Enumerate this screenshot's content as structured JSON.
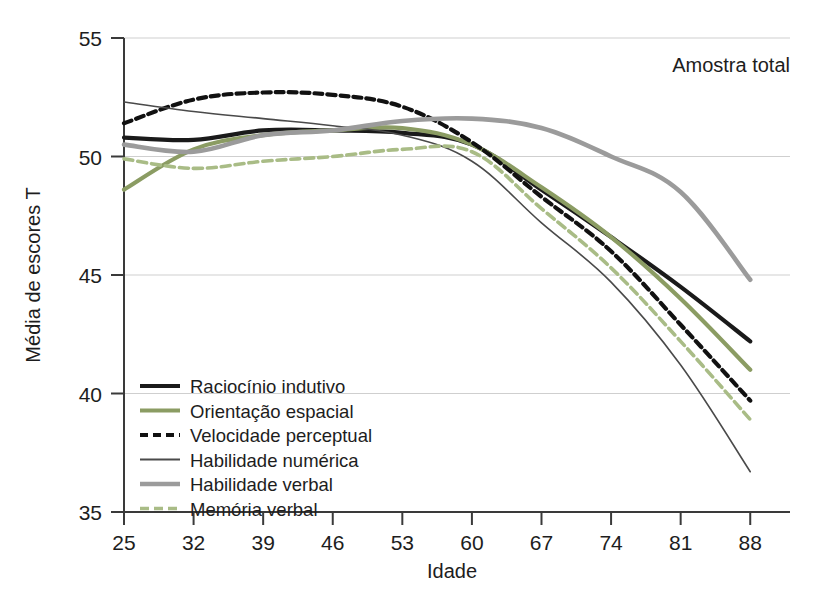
{
  "chart_data": {
    "type": "line",
    "title": "",
    "annotation": "Amostra total",
    "xlabel": "Idade",
    "ylabel": "Média de escores T",
    "x": [
      25,
      32,
      39,
      46,
      53,
      60,
      67,
      74,
      81,
      88
    ],
    "xticklabels": [
      "25",
      "32",
      "39",
      "46",
      "53",
      "60",
      "67",
      "74",
      "81",
      "88"
    ],
    "yticklabels": [
      "35",
      "40",
      "45",
      "50",
      "55"
    ],
    "yticks": [
      35,
      40,
      45,
      50,
      55
    ],
    "xlim": [
      25,
      92
    ],
    "ylim": [
      35,
      55
    ],
    "grid": true,
    "legend_position": "lower-left-inside",
    "series": [
      {
        "name": "Raciocínio indutivo",
        "color": "#1a1a1a",
        "width": 4.2,
        "dash": "none",
        "values": [
          50.8,
          50.7,
          51.1,
          51.1,
          51.0,
          50.5,
          48.6,
          46.6,
          44.5,
          42.2
        ]
      },
      {
        "name": "Orientação espacial",
        "color": "#8b9c63",
        "width": 4.2,
        "dash": "none",
        "values": [
          48.6,
          50.3,
          50.9,
          51.1,
          51.2,
          50.5,
          48.7,
          46.6,
          44.0,
          41.0
        ]
      },
      {
        "name": "Velocidade perceptual",
        "color": "#111111",
        "width": 4.2,
        "dash": "8,5",
        "values": [
          51.4,
          52.4,
          52.7,
          52.6,
          52.1,
          50.6,
          48.3,
          46.0,
          42.9,
          39.7
        ]
      },
      {
        "name": "Habilidade numérica",
        "color": "#4a4a4a",
        "width": 1.6,
        "dash": "none",
        "values": [
          52.3,
          51.9,
          51.6,
          51.3,
          50.9,
          49.8,
          47.2,
          44.7,
          41.2,
          36.7
        ]
      },
      {
        "name": "Habilidade verbal",
        "color": "#9b9b9b",
        "width": 4.6,
        "dash": "none",
        "values": [
          50.5,
          50.2,
          50.9,
          51.1,
          51.5,
          51.6,
          51.2,
          50.0,
          48.5,
          44.8
        ]
      },
      {
        "name": "Memória verbal",
        "color": "#a9bc86",
        "width": 3.6,
        "dash": "9,5",
        "values": [
          49.9,
          49.5,
          49.8,
          50.0,
          50.3,
          50.2,
          47.8,
          45.3,
          42.2,
          38.9
        ]
      }
    ]
  },
  "legend": {
    "items": [
      "Raciocínio indutivo",
      "Orientação espacial",
      "Velocidade perceptual",
      "Habilidade numérica",
      "Habilidade verbal",
      "Memória verbal"
    ]
  }
}
